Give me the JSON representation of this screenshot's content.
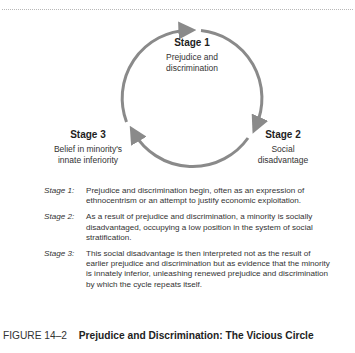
{
  "figure": {
    "number": "FIGURE 14–2",
    "title": "Prejudice and Discrimination: The Vicious Circle"
  },
  "colors": {
    "arrow": "#8a8a8a",
    "text": "#2a2a2a"
  },
  "cycle": {
    "stages": [
      {
        "title": "Stage 1",
        "description_lines": [
          "Prejudice and",
          "discrimination"
        ]
      },
      {
        "title": "Stage 2",
        "description_lines": [
          "Social",
          "disadvantage"
        ]
      },
      {
        "title": "Stage 3",
        "description_lines": [
          "Belief in minority's",
          "innate inferiority"
        ]
      }
    ]
  },
  "notes": [
    {
      "key": "Stage 1:",
      "text": "Prejudice and discrimination begin, often as an expression of ethnocentrism or an attempt to justify economic exploitation."
    },
    {
      "key": "Stage 2:",
      "text": "As a result of prejudice and discrimination, a minority is socially disadvantaged, occupying a low position in the system of social stratification."
    },
    {
      "key": "Stage 3:",
      "text": "This social disadvantage is then interpreted not as the result of earlier prejudice and discrimination but as evidence that the minority is innately inferior, unleashing renewed prejudice and discrimination by which the cycle repeats itself."
    }
  ]
}
